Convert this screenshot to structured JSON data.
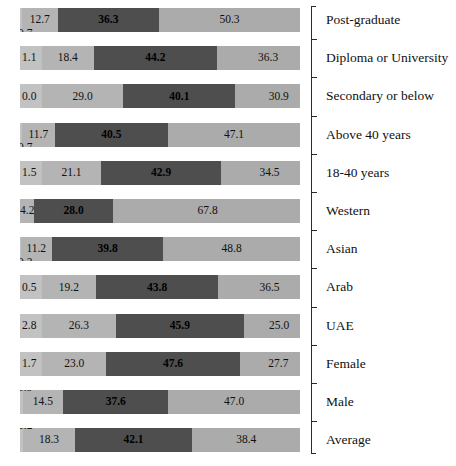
{
  "chart_data": {
    "type": "bar",
    "orientation": "horizontal",
    "stacked": true,
    "stack_mode": "percent",
    "title": "",
    "subtitle": "",
    "xlabel": "",
    "ylabel": "",
    "xlim": [
      0,
      100
    ],
    "grid": false,
    "legend": "none",
    "axis_position": "right",
    "value_format": "one-decimal-percent",
    "categories": [
      "Post-graduate",
      "Diploma or University",
      "Secondary or below",
      "Above 40 years",
      "18-40 years",
      "Western",
      "Asian",
      "Arab",
      "UAE",
      "Female",
      "Male",
      "Average"
    ],
    "series": [
      {
        "name": "Segment 1",
        "color": "#c2c2c2",
        "values": [
          0.7,
          1.1,
          0.0,
          0.7,
          1.5,
          0.0,
          0.2,
          0.5,
          2.8,
          1.7,
          0.9,
          1.2
        ]
      },
      {
        "name": "Segment 2",
        "color": "#b4b4b4",
        "values": [
          12.7,
          18.4,
          29.0,
          11.7,
          21.1,
          4.2,
          11.2,
          19.2,
          26.3,
          23.0,
          14.5,
          18.3
        ]
      },
      {
        "name": "Segment 3",
        "color": "#4e4e4e",
        "values": [
          36.3,
          44.2,
          40.1,
          40.5,
          42.9,
          28.0,
          39.8,
          43.8,
          45.9,
          47.6,
          37.6,
          42.1
        ]
      },
      {
        "name": "Segment 4",
        "color": "#ababab",
        "values": [
          50.3,
          36.3,
          30.9,
          47.1,
          34.5,
          67.8,
          48.8,
          36.5,
          25.0,
          27.7,
          47.0,
          38.4
        ]
      }
    ],
    "rows": [
      {
        "category": "Post-graduate",
        "segments": [
          {
            "value": "0.7",
            "pct": 0.7
          },
          {
            "value": "12.7",
            "pct": 12.7
          },
          {
            "value": "36.3",
            "pct": 36.3
          },
          {
            "value": "50.3",
            "pct": 50.3
          }
        ]
      },
      {
        "category": "Diploma or University",
        "segments": [
          {
            "value": "1.1",
            "pct": 1.1
          },
          {
            "value": "18.4",
            "pct": 18.4
          },
          {
            "value": "44.2",
            "pct": 44.2
          },
          {
            "value": "36.3",
            "pct": 36.3
          }
        ]
      },
      {
        "category": "Secondary or below",
        "segments": [
          {
            "value": "0.0",
            "pct": 0.0
          },
          {
            "value": "29.0",
            "pct": 29.0
          },
          {
            "value": "40.1",
            "pct": 40.1
          },
          {
            "value": "30.9",
            "pct": 30.9
          }
        ]
      },
      {
        "category": "Above 40 years",
        "segments": [
          {
            "value": "0.7",
            "pct": 0.7
          },
          {
            "value": "11.7",
            "pct": 11.7
          },
          {
            "value": "40.5",
            "pct": 40.5
          },
          {
            "value": "47.1",
            "pct": 47.1
          }
        ]
      },
      {
        "category": "18-40 years",
        "segments": [
          {
            "value": "1.5",
            "pct": 1.5
          },
          {
            "value": "21.1",
            "pct": 21.1
          },
          {
            "value": "42.9",
            "pct": 42.9
          },
          {
            "value": "34.5",
            "pct": 34.5
          }
        ]
      },
      {
        "category": "Western",
        "segments": [
          {
            "value": "",
            "pct": 0.0
          },
          {
            "value": "4.2",
            "pct": 4.2
          },
          {
            "value": "28.0",
            "pct": 28.0
          },
          {
            "value": "67.8",
            "pct": 67.8
          }
        ]
      },
      {
        "category": "Asian",
        "segments": [
          {
            "value": "0.2",
            "pct": 0.2
          },
          {
            "value": "11.2",
            "pct": 11.2
          },
          {
            "value": "39.8",
            "pct": 39.8
          },
          {
            "value": "48.8",
            "pct": 48.8
          }
        ]
      },
      {
        "category": "Arab",
        "segments": [
          {
            "value": "0.5",
            "pct": 0.5
          },
          {
            "value": "19.2",
            "pct": 19.2
          },
          {
            "value": "43.8",
            "pct": 43.8
          },
          {
            "value": "36.5",
            "pct": 36.5
          }
        ]
      },
      {
        "category": "UAE",
        "segments": [
          {
            "value": "2.8",
            "pct": 2.8
          },
          {
            "value": "26.3",
            "pct": 26.3
          },
          {
            "value": "45.9",
            "pct": 45.9
          },
          {
            "value": "25.0",
            "pct": 25.0
          }
        ]
      },
      {
        "category": "Female",
        "segments": [
          {
            "value": "1.7",
            "pct": 1.7
          },
          {
            "value": "23.0",
            "pct": 23.0
          },
          {
            "value": "47.6",
            "pct": 47.6
          },
          {
            "value": "27.7",
            "pct": 27.7
          }
        ]
      },
      {
        "category": "Male",
        "segments": [
          {
            "value": "0.9",
            "pct": 0.9
          },
          {
            "value": "14.5",
            "pct": 14.5
          },
          {
            "value": "37.6",
            "pct": 37.6
          },
          {
            "value": "47.0",
            "pct": 47.0
          }
        ]
      },
      {
        "category": "Average",
        "segments": [
          {
            "value": "1.2",
            "pct": 1.2
          },
          {
            "value": "18.3",
            "pct": 18.3
          },
          {
            "value": "42.1",
            "pct": 42.1
          },
          {
            "value": "38.4",
            "pct": 38.4
          }
        ]
      }
    ]
  },
  "layout": {
    "plot_left": 20,
    "plot_width": 280,
    "row_pitch": 38.2,
    "row_top": 8,
    "bar_height": 24,
    "axis_x": 311,
    "label_x": 326,
    "colors": {
      "segment_1": "#c2c2c2",
      "segment_2": "#b4b4b4",
      "segment_3": "#4e4e4e",
      "segment_4": "#ababab",
      "axis": "#2b2b2b",
      "text": "#111111",
      "background": "#ffffff"
    },
    "tiny_label_placement": [
      "below",
      "inline",
      "inline",
      "below",
      "inline",
      "none",
      "below",
      "inline",
      "inline",
      "inline",
      "above",
      "above"
    ]
  }
}
